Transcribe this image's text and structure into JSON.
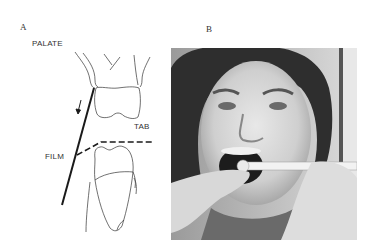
{
  "panels": {
    "a": {
      "label": "A",
      "labels": {
        "palate": "PALATE",
        "tab": "TAB",
        "film": "FILM"
      }
    },
    "b": {
      "label": "B",
      "photo_description": "grayscale photo of a woman with mouth open while a dental film tab is held in her mouth"
    }
  },
  "colors": {
    "line": "#222222",
    "text": "#333333"
  }
}
